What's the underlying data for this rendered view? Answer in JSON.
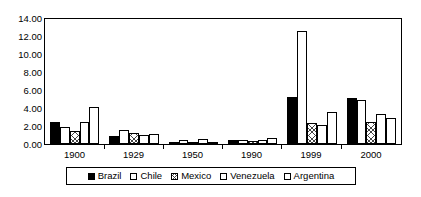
{
  "chart_data": {
    "type": "bar",
    "title": "",
    "subtitle": "",
    "xlabel": "",
    "ylabel": "",
    "categories": [
      "1900",
      "1929",
      "1950",
      "1990",
      "1999",
      "2000"
    ],
    "series": [
      {
        "name": "Brazil",
        "pattern": "solid-black",
        "values": [
          2.5,
          0.95,
          0.2,
          0.4,
          5.3,
          5.15
        ]
      },
      {
        "name": "Chile",
        "pattern": "fine-dots",
        "values": [
          1.85,
          1.55,
          0.45,
          0.4,
          12.7,
          4.95
        ]
      },
      {
        "name": "Mexico",
        "pattern": "cross-hatch",
        "values": [
          1.5,
          1.25,
          0.05,
          0.35,
          2.3,
          2.45
        ]
      },
      {
        "name": "Venezuela",
        "pattern": "empty-white",
        "values": [
          2.5,
          1.05,
          0.55,
          0.5,
          2.15,
          3.4
        ]
      },
      {
        "name": "Argentina",
        "pattern": "fine-dots",
        "values": [
          4.15,
          1.1,
          0.1,
          0.65,
          3.6,
          2.9
        ]
      }
    ],
    "ylim": [
      0,
      14
    ],
    "ytick_step": 2,
    "ytick_labels": [
      "0.00",
      "2.00",
      "4.00",
      "6.00",
      "8.00",
      "10.00",
      "12.00",
      "14.00"
    ],
    "grid": false,
    "legend_position": "bottom",
    "legend_entries": [
      "Brazil",
      "Chile",
      "Mexico",
      "Venezuela",
      "Argentina"
    ]
  },
  "axes": {
    "y_labels": [
      "14.00",
      "12.00",
      "10.00",
      "8.00",
      "6.00",
      "4.00",
      "2.00",
      "0.00"
    ],
    "x_labels": [
      "1900",
      "1929",
      "1950",
      "1990",
      "1999",
      "2000"
    ]
  },
  "legend": {
    "items": [
      {
        "label": "Brazil"
      },
      {
        "label": "Chile"
      },
      {
        "label": "Mexico"
      },
      {
        "label": "Venezuela"
      },
      {
        "label": "Argentina"
      }
    ]
  },
  "colors": {
    "axis": "#000000",
    "background": "#ffffff",
    "brazil": "#000000",
    "chile": "#ffffff",
    "mexico": "#ffffff",
    "venezuela": "#ffffff",
    "argentina": "#ffffff"
  }
}
